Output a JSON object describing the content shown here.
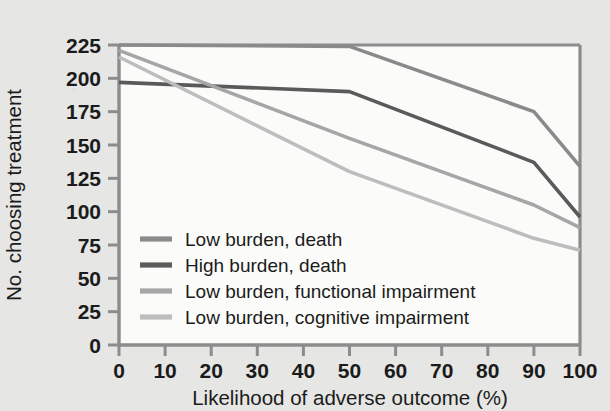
{
  "chart_data": {
    "type": "line",
    "title": "",
    "xlabel": "Likelihood of adverse outcome (%)",
    "ylabel": "No. choosing treatment",
    "xlim": [
      0,
      100
    ],
    "ylim": [
      0,
      225
    ],
    "xticks": [
      0,
      10,
      20,
      30,
      40,
      50,
      60,
      70,
      80,
      90,
      100
    ],
    "yticks": [
      0,
      25,
      50,
      75,
      100,
      125,
      150,
      175,
      200,
      225
    ],
    "xtick_labels": [
      "0",
      "10",
      "20",
      "30",
      "40",
      "50",
      "60",
      "70",
      "80",
      "90",
      "100"
    ],
    "ytick_labels": [
      "0",
      "25",
      "50",
      "75",
      "100",
      "125",
      "150",
      "175",
      "200",
      "225"
    ],
    "grid": false,
    "legend_position": "lower-left-inside",
    "x": [
      0,
      50,
      90,
      100
    ],
    "series": [
      {
        "name": "Low burden, death",
        "color": "#8a8a8a",
        "values": [
          225,
          224,
          175,
          134
        ]
      },
      {
        "name": "High burden, death",
        "color": "#5a5a5a",
        "values": [
          197,
          190,
          137,
          96
        ]
      },
      {
        "name": "Low burden, functional impairment",
        "color": "#a6a6a6",
        "values": [
          221,
          155,
          105,
          88
        ]
      },
      {
        "name": "Low burden, cognitive impairment",
        "color": "#bdbdbd",
        "values": [
          216,
          130,
          80,
          71
        ]
      }
    ]
  },
  "legend": {
    "entries": [
      {
        "label": "Low burden, death",
        "color": "#8a8a8a"
      },
      {
        "label": "High burden, death",
        "color": "#5a5a5a"
      },
      {
        "label": "Low burden, functional impairment",
        "color": "#a6a6a6"
      },
      {
        "label": "Low burden, cognitive impairment",
        "color": "#bdbdbd"
      }
    ]
  },
  "colors": {
    "background": "#e6e6e4",
    "plot_background": "#fbfbfa",
    "frame": "#8c8c8c",
    "text": "#1b1b1b"
  }
}
